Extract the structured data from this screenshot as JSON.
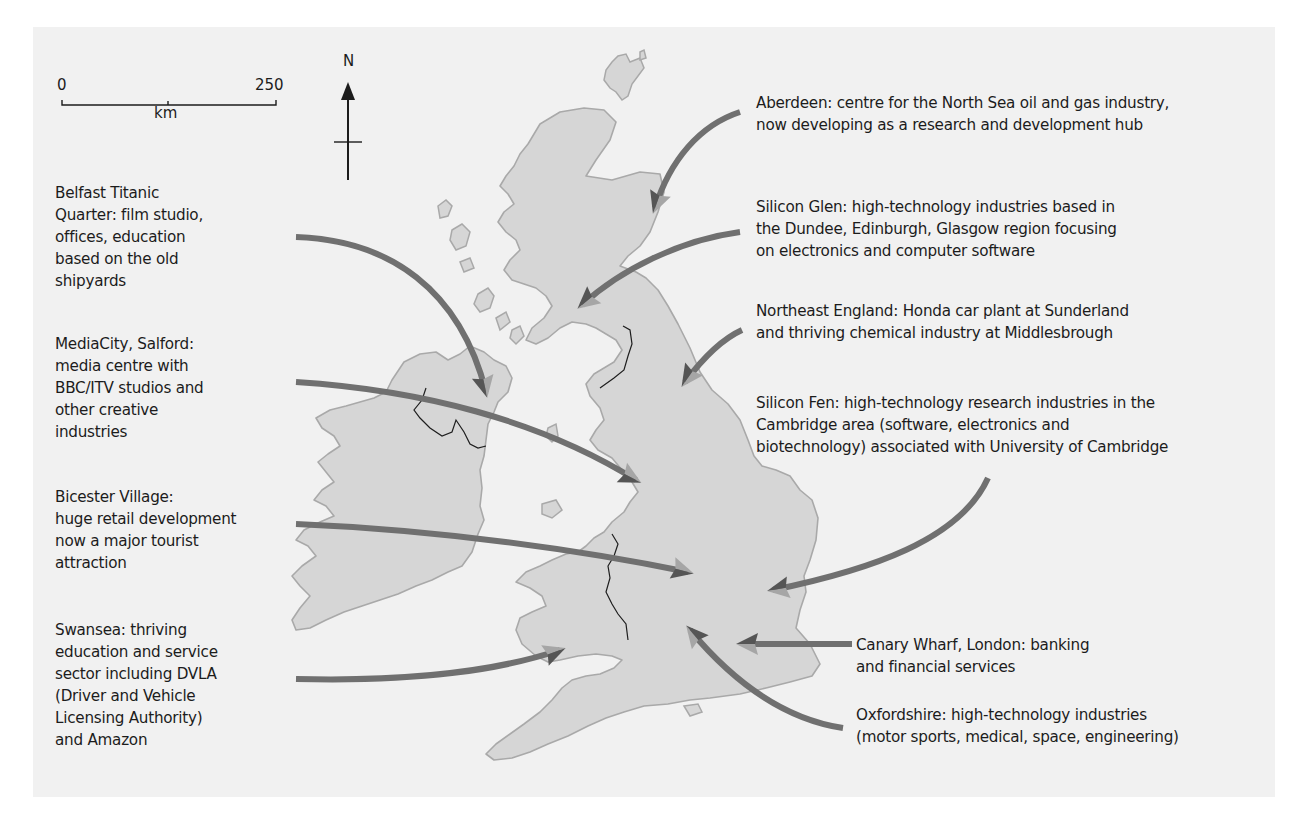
{
  "map": {
    "colors": {
      "page_background": "#ffffff",
      "panel_background": "#f1f1f1",
      "land_fill": "#d6d6d6",
      "coast_stroke": "#a9a9a9",
      "border_stroke": "#1e1e1e",
      "arrow_shaft": "#707070",
      "arrow_head_light": "#a6a6a6",
      "arrow_head_dark": "#555555",
      "text": "#1c1c1c"
    },
    "scale_bar": {
      "start_label": "0",
      "end_label": "250",
      "unit_label": "km"
    },
    "north_arrow": {
      "label": "N"
    },
    "annotations": [
      {
        "id": "belfast",
        "text": "Belfast Titanic\nQuarter: film studio,\noffices, education\nbased on the old\nshipyards",
        "x": 55,
        "y": 180,
        "side": "left",
        "arrow": {
          "path": "M296,237 C390,240 460,290 486,392",
          "head": [
            486,
            392
          ],
          "angle": 78
        }
      },
      {
        "id": "mediacity",
        "text": "MediaCity, Salford:\nmedia centre with\nBBC/ITV studios and\nother creative\nindustries",
        "x": 55,
        "y": 332,
        "side": "left",
        "arrow": {
          "path": "M296,382 C420,390 540,420 636,480",
          "head": [
            636,
            480
          ],
          "angle": 28
        }
      },
      {
        "id": "bicester",
        "text": "Bicester Village:\nhuge retail development\nnow a major tourist\nattraction",
        "x": 55,
        "y": 486,
        "side": "left",
        "arrow": {
          "path": "M296,524 C440,530 580,550 688,572",
          "head": [
            688,
            572
          ],
          "angle": 15
        }
      },
      {
        "id": "swansea",
        "text": "Swansea: thriving\neducation and service\nsector including DVLA\n(Driver and Vehicle\nLicensing Authority)\nand Amazon",
        "x": 55,
        "y": 618,
        "side": "left",
        "arrow": {
          "path": "M296,679 C420,682 500,670 560,650",
          "head": [
            560,
            650
          ],
          "angle": -20
        }
      },
      {
        "id": "aberdeen",
        "text": "Aberdeen: centre for the North Sea oil and gas industry,\nnow developing as a research and development hub",
        "x": 756,
        "y": 94,
        "side": "right",
        "arrow": {
          "path": "M740,112 C700,125 670,160 655,208",
          "head": [
            655,
            208
          ],
          "angle": 110
        }
      },
      {
        "id": "silicon_glen",
        "text": "Silicon Glen: high-technology industries based in\nthe Dundee, Edinburgh, Glasgow region focusing\non electronics and computer software",
        "x": 756,
        "y": 198,
        "side": "right",
        "arrow": {
          "path": "M740,232 C680,240 620,270 582,305",
          "head": [
            582,
            305
          ],
          "angle": 140
        }
      },
      {
        "id": "northeast",
        "text": "Northeast England: Honda car plant at Sunderland\nand thriving chemical industry at Middlesbrough",
        "x": 756,
        "y": 302,
        "side": "right",
        "arrow": {
          "path": "M742,330 C720,340 700,362 685,382",
          "head": [
            685,
            382
          ],
          "angle": 125
        }
      },
      {
        "id": "silicon_fen",
        "text": "Silicon Fen: high-technology research industries in the\nCambridge area (software, electronics and\nbiotechnology) associated with University of Cambridge",
        "x": 756,
        "y": 394,
        "side": "right",
        "arrow": {
          "path": "M988,478 C960,540 870,570 773,590",
          "head": [
            773,
            590
          ],
          "angle": 170
        }
      },
      {
        "id": "canary_wharf",
        "text": "Canary Wharf, London: banking\nand financial services",
        "x": 856,
        "y": 636,
        "side": "right",
        "arrow": {
          "path": "M852,644 L742,644",
          "head": [
            742,
            644
          ],
          "angle": 180
        }
      },
      {
        "id": "oxfordshire",
        "text": "Oxfordshire: high-technology industries\n(motor sports, medical, space, engineering)",
        "x": 856,
        "y": 706,
        "side": "right",
        "arrow": {
          "path": "M843,728 C790,720 740,690 690,630",
          "head": [
            690,
            630
          ],
          "angle": -130
        }
      }
    ]
  }
}
